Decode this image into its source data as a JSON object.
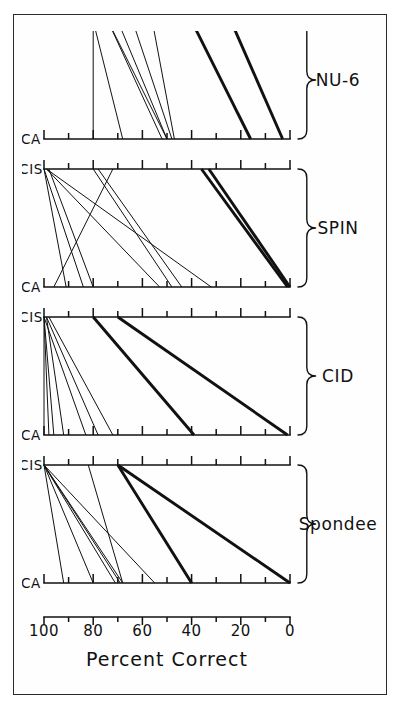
{
  "figure": {
    "y_axis_title": "Percent Correct",
    "condition_labels": [
      "CA",
      "CIS"
    ],
    "tick_labels": [
      "100",
      "80",
      "60",
      "40",
      "20",
      "0"
    ],
    "tick_values": [
      100,
      80,
      60,
      40,
      20,
      0
    ],
    "minor_tick_step": 10,
    "panel_labels": [
      "Spondee",
      "CID",
      "SPIN",
      "NU-6"
    ],
    "line_color": "#111111",
    "background_color": "#ffffff",
    "frame_color": "#2a2a2a"
  },
  "chart_data": {
    "type": "line",
    "title": "",
    "subtitle": "",
    "xlabel": "",
    "ylabel": "Percent Correct",
    "ylim": [
      0,
      100
    ],
    "grid": false,
    "legend": "none",
    "x": [
      "CA",
      "CIS"
    ],
    "xtick_labels": [
      "CA",
      "CIS"
    ],
    "ytick_labels": [
      "0",
      "20",
      "40",
      "60",
      "80",
      "100"
    ],
    "ytick_values": [
      0,
      20,
      40,
      60,
      80,
      100
    ],
    "note": "Paired slope (spaghetti) plot: each line is one subject, joining CA score to CIS score. Thick lines mark the two largest improvements in each test panel.",
    "panels": [
      {
        "name": "Spondee",
        "series": [
          {
            "name": "S1",
            "values": [
              92,
              100
            ],
            "weight": "thin"
          },
          {
            "name": "S2",
            "values": [
              80,
              100
            ],
            "weight": "thin"
          },
          {
            "name": "S3",
            "values": [
              71,
              100
            ],
            "weight": "thin"
          },
          {
            "name": "S4",
            "values": [
              69,
              100
            ],
            "weight": "thin"
          },
          {
            "name": "S5",
            "values": [
              68,
              100
            ],
            "weight": "thin"
          },
          {
            "name": "S6",
            "values": [
              68,
              82
            ],
            "weight": "thin"
          },
          {
            "name": "S7",
            "values": [
              55,
              100
            ],
            "weight": "thin"
          },
          {
            "name": "S8",
            "values": [
              40,
              70
            ],
            "weight": "thick"
          },
          {
            "name": "S9",
            "values": [
              0,
              70
            ],
            "weight": "thick"
          }
        ]
      },
      {
        "name": "CID",
        "series": [
          {
            "name": "S1",
            "values": [
              100,
              100
            ],
            "weight": "thin"
          },
          {
            "name": "S2",
            "values": [
              98,
              100
            ],
            "weight": "thin"
          },
          {
            "name": "S3",
            "values": [
              96,
              100
            ],
            "weight": "thin"
          },
          {
            "name": "S4",
            "values": [
              92,
              99
            ],
            "weight": "thin"
          },
          {
            "name": "S5",
            "values": [
              83,
              100
            ],
            "weight": "thin"
          },
          {
            "name": "S6",
            "values": [
              78,
              99
            ],
            "weight": "thin"
          },
          {
            "name": "S7",
            "values": [
              72,
              98
            ],
            "weight": "thin"
          },
          {
            "name": "S8",
            "values": [
              39,
              80
            ],
            "weight": "thick"
          },
          {
            "name": "S9",
            "values": [
              1,
              70
            ],
            "weight": "thick"
          }
        ]
      },
      {
        "name": "SPIN",
        "series": [
          {
            "name": "S1",
            "values": [
              96,
              72
            ],
            "weight": "thin"
          },
          {
            "name": "S2",
            "values": [
              91,
              100
            ],
            "weight": "thin"
          },
          {
            "name": "S3",
            "values": [
              84,
              100
            ],
            "weight": "thin"
          },
          {
            "name": "S4",
            "values": [
              80,
              98
            ],
            "weight": "thin"
          },
          {
            "name": "S5",
            "values": [
              53,
              99
            ],
            "weight": "thin"
          },
          {
            "name": "S6",
            "values": [
              48,
              80
            ],
            "weight": "thin"
          },
          {
            "name": "S7",
            "values": [
              44,
              78
            ],
            "weight": "thin"
          },
          {
            "name": "S8",
            "values": [
              32,
              99
            ],
            "weight": "thin"
          },
          {
            "name": "S9",
            "values": [
              1,
              36
            ],
            "weight": "thick"
          },
          {
            "name": "S10",
            "values": [
              0,
              33
            ],
            "weight": "thick"
          }
        ]
      },
      {
        "name": "NU-6",
        "series": [
          {
            "name": "S1",
            "values": [
              80,
              80
            ],
            "weight": "thin"
          },
          {
            "name": "S2",
            "values": [
              68,
              80
            ],
            "weight": "thin"
          },
          {
            "name": "S3",
            "values": [
              52,
              74
            ],
            "weight": "thin"
          },
          {
            "name": "S4",
            "values": [
              50,
              74
            ],
            "weight": "thin"
          },
          {
            "name": "S5",
            "values": [
              50,
              70
            ],
            "weight": "thin"
          },
          {
            "name": "S6",
            "values": [
              48,
              64
            ],
            "weight": "thin"
          },
          {
            "name": "S7",
            "values": [
              47,
              56
            ],
            "weight": "thin"
          },
          {
            "name": "S8",
            "values": [
              16,
              40
            ],
            "weight": "thick"
          },
          {
            "name": "S9",
            "values": [
              3,
              24
            ],
            "weight": "thick"
          }
        ]
      }
    ]
  }
}
